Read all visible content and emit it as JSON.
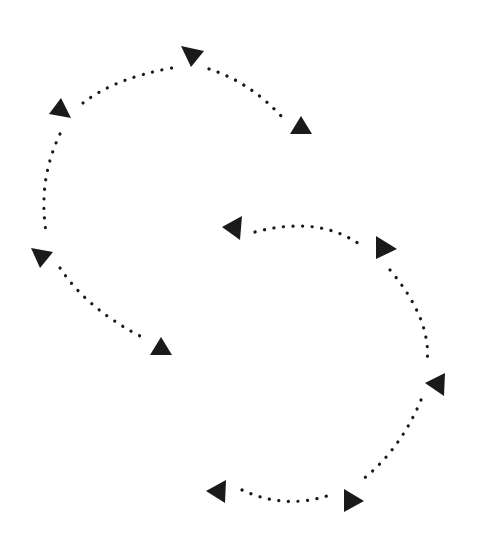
{
  "diagram": {
    "background": "#ffffff",
    "ink": "#1a1a1a",
    "dot_spacing": 9.5,
    "groups": [
      {
        "name": "upper-left-cycle",
        "arcs": [
          {
            "name": "arc-top-left",
            "d": "M 83 103 Q 115 78 172 68"
          },
          {
            "name": "arc-top-right",
            "d": "M 209 69 Q 250 82 283 118"
          },
          {
            "name": "arc-left",
            "d": "M 60 134 Q 38 180 46 232"
          },
          {
            "name": "arc-bottom-left",
            "d": "M 60 268 Q 88 310 144 338"
          }
        ],
        "arrows": [
          {
            "name": "arrowhead-top",
            "points": "181,46 204,51 191,67"
          },
          {
            "name": "arrowhead-top-right",
            "points": "301,116 312,134 290,134"
          },
          {
            "name": "arrowhead-upper-left",
            "points": "61,98 71,118 49,114"
          },
          {
            "name": "arrowhead-left",
            "points": "31,248 53,252 40,268"
          },
          {
            "name": "arrowhead-bottom-right",
            "points": "161,337 172,355 150,355"
          }
        ]
      },
      {
        "name": "lower-right-cycle",
        "arcs": [
          {
            "name": "arc-top",
            "d": "M 255 232 Q 320 215 362 246"
          },
          {
            "name": "arc-right",
            "d": "M 390 270 Q 432 320 427 363"
          },
          {
            "name": "arc-lower-right",
            "d": "M 421 400 Q 400 450 362 480"
          },
          {
            "name": "arc-bottom",
            "d": "M 242 490 Q 285 510 330 495"
          }
        ],
        "arrows": [
          {
            "name": "arrowhead-top-left",
            "points": "222,227 242,216 240,240"
          },
          {
            "name": "arrowhead-top-right",
            "points": "376,236 397,249 376,259"
          },
          {
            "name": "arrowhead-right",
            "points": "425,383 445,373 444,396"
          },
          {
            "name": "arrowhead-bottom-right",
            "points": "344,489 364,501 344,512"
          },
          {
            "name": "arrowhead-bottom-left",
            "points": "206,491 226,480 225,503"
          }
        ]
      }
    ]
  }
}
